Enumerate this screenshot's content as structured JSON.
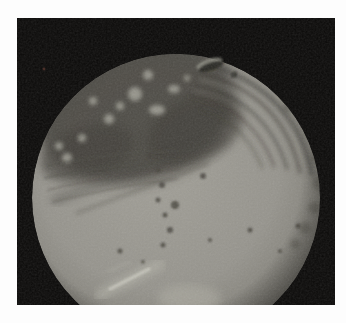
{
  "scene": {
    "description": "Grainy photograph of a spherical moon-like body: a dark mottled albedo cap across its upper region with bright spots, diagonal ridge striations on the upper-right limb, smoother bright grey terrain below with small dark crater specks and a bright diagonal streak near the bottom, an oblique crater on the top limb, all against black space inside a white page margin",
    "page_background": "#fdfdfd",
    "photo": {
      "background": "#0a0908"
    },
    "star_speck_color": "#6e3b30",
    "moon": {
      "base_light": "#a19f97",
      "base_mid": "#96948d",
      "base_edge": "#6e6c64",
      "dark_region": "#45433c",
      "dark_patch": "#3c3a34",
      "striation": "#3b3933",
      "ridge_highlight": "#8d8c82",
      "bright_spot": "#a3a298",
      "speck": "#46443e",
      "hummock": "#57554d",
      "bright_streak": "#c6c5bb",
      "streak_glow": "#b3b2a8",
      "bottom_patch": "#adaca2",
      "crater_floor": "#23221e",
      "crater_rim": "#8f8e84",
      "rim_shadow": "#0c0b09"
    }
  }
}
